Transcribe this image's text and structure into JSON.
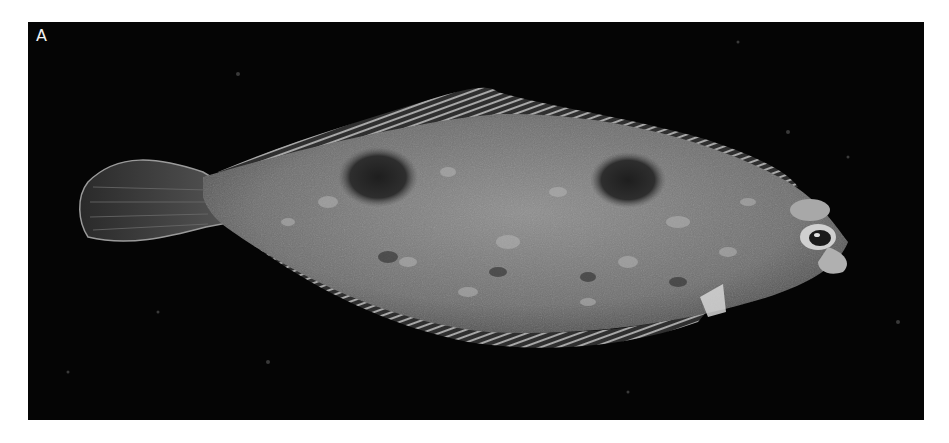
{
  "figure": {
    "panel_label": "A",
    "colors": {
      "background": "#ffffff",
      "photo_background": "#050505",
      "fish_body": "#7a7a7a",
      "fish_highlight": "#b8b8b8",
      "fish_dark_spots": "#2a2a2a",
      "fin_rays": "#d8d8d8",
      "label_text": "#f2f2f2"
    }
  }
}
